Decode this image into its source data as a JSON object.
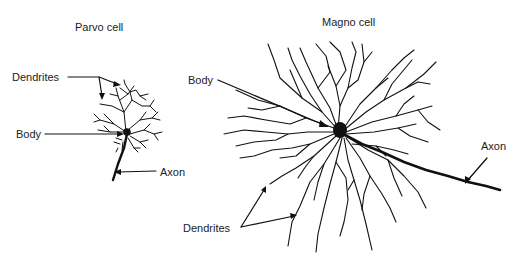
{
  "figure": {
    "parvo": {
      "title": "Parvo cell",
      "labels": {
        "dendrites": "Dendrites",
        "body": "Body",
        "axon": "Axon"
      }
    },
    "magno": {
      "title": "Magno cell",
      "labels": {
        "body": "Body",
        "axon": "Axon",
        "dendrites": "Dendrites"
      }
    },
    "colors": {
      "ink": "#111111",
      "background": "#ffffff"
    }
  }
}
